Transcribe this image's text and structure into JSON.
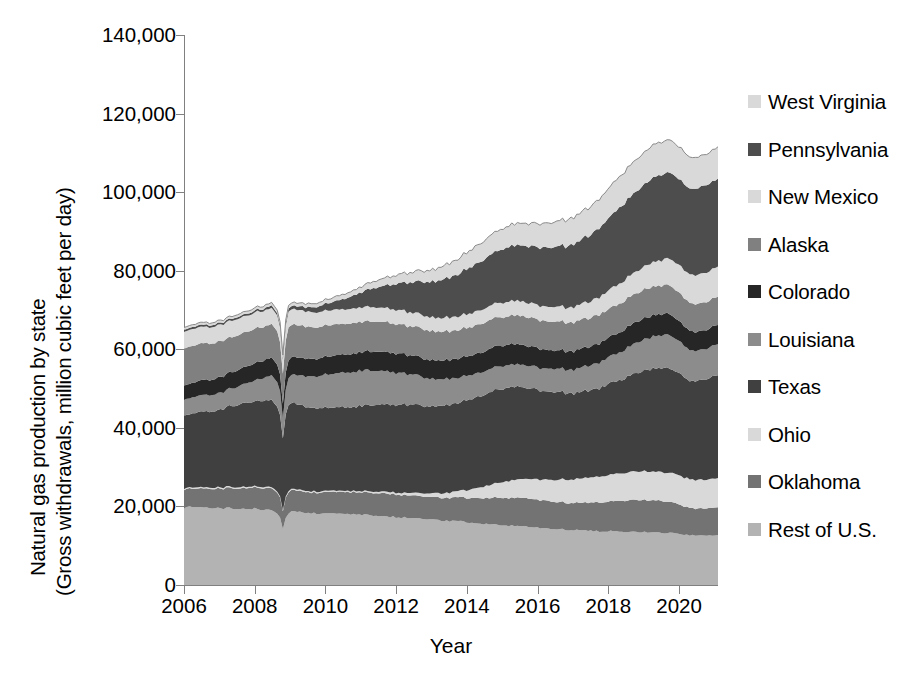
{
  "chart_data": {
    "type": "area",
    "stacked": true,
    "title": "",
    "xlabel": "Year",
    "ylabel": "Natural gas production by state (Gross withdrawals, million cubic feet per day)",
    "ylabel_line1": "Natural gas production by state",
    "ylabel_line2": "(Gross withdrawals, million cubic feet per day)",
    "xlim": [
      2006,
      2021.1
    ],
    "ylim": [
      0,
      140000
    ],
    "ytick_values": [
      0,
      20000,
      40000,
      60000,
      80000,
      100000,
      120000,
      140000
    ],
    "ytick_labels": [
      "0",
      "20,000",
      "40,000",
      "60,000",
      "80,000",
      "100,000",
      "120,000",
      "140,000"
    ],
    "xtick_values": [
      2006,
      2008,
      2010,
      2012,
      2014,
      2016,
      2018,
      2020
    ],
    "xtick_labels": [
      "2006",
      "2008",
      "2010",
      "2012",
      "2014",
      "2016",
      "2018",
      "2020"
    ],
    "grid": false,
    "legend_position": "right",
    "x": [
      2006.0,
      2006.25,
      2006.5,
      2006.75,
      2007.0,
      2007.25,
      2007.5,
      2007.75,
      2008.0,
      2008.25,
      2008.5,
      2008.7,
      2008.8,
      2008.9,
      2009.0,
      2009.25,
      2009.5,
      2009.75,
      2010.0,
      2010.25,
      2010.5,
      2010.75,
      2011.0,
      2011.25,
      2011.5,
      2011.75,
      2012.0,
      2012.25,
      2012.5,
      2012.75,
      2013.0,
      2013.25,
      2013.5,
      2013.75,
      2014.0,
      2014.25,
      2014.5,
      2014.75,
      2015.0,
      2015.25,
      2015.5,
      2015.75,
      2016.0,
      2016.25,
      2016.5,
      2016.75,
      2017.0,
      2017.25,
      2017.5,
      2017.75,
      2018.0,
      2018.25,
      2018.5,
      2018.75,
      2019.0,
      2019.25,
      2019.5,
      2019.75,
      2020.0,
      2020.25,
      2020.5,
      2020.75,
      2021.0
    ],
    "series": [
      {
        "name": "Rest of U.S.",
        "color": "#b3b3b3",
        "values": [
          19800,
          19900,
          19700,
          19600,
          19500,
          19600,
          19400,
          19500,
          19400,
          19200,
          19000,
          17600,
          14200,
          17800,
          18800,
          18500,
          18400,
          18200,
          18300,
          18200,
          18000,
          17900,
          17900,
          17700,
          17600,
          17500,
          17300,
          17200,
          17000,
          16800,
          16600,
          16400,
          16300,
          16200,
          16000,
          15800,
          15600,
          15500,
          15300,
          15100,
          15000,
          14800,
          14600,
          14400,
          14300,
          14100,
          14000,
          13900,
          13800,
          13700,
          13700,
          13600,
          13600,
          13500,
          13500,
          13400,
          13300,
          13200,
          13000,
          12700,
          12600,
          12600,
          12700
        ]
      },
      {
        "name": "Oklahoma",
        "color": "#737373",
        "values": [
          4600,
          4700,
          4800,
          4900,
          5000,
          5100,
          5200,
          5300,
          5400,
          5500,
          5500,
          5300,
          4600,
          5400,
          5400,
          5300,
          5300,
          5300,
          5400,
          5500,
          5600,
          5600,
          5700,
          5700,
          5800,
          5800,
          5800,
          5700,
          5700,
          5700,
          5700,
          5800,
          5900,
          6000,
          6200,
          6400,
          6600,
          6800,
          7000,
          7100,
          7200,
          7200,
          7100,
          7000,
          6900,
          6900,
          6900,
          7000,
          7200,
          7400,
          7600,
          7800,
          8000,
          8100,
          8200,
          8200,
          8100,
          7900,
          7500,
          7000,
          6800,
          6900,
          7100
        ]
      },
      {
        "name": "Ohio",
        "color": "#d9d9d9",
        "values": [
          300,
          300,
          300,
          300,
          300,
          300,
          300,
          300,
          300,
          300,
          300,
          300,
          250,
          300,
          300,
          300,
          300,
          300,
          300,
          300,
          300,
          300,
          300,
          350,
          400,
          450,
          500,
          600,
          700,
          800,
          950,
          1100,
          1300,
          1600,
          2000,
          2500,
          3000,
          3500,
          4000,
          4400,
          4700,
          5000,
          5200,
          5400,
          5600,
          5800,
          6000,
          6200,
          6400,
          6600,
          6800,
          7000,
          7100,
          7200,
          7300,
          7300,
          7400,
          7400,
          7400,
          7300,
          7300,
          7300,
          7400
        ]
      },
      {
        "name": "Texas",
        "color": "#404040",
        "values": [
          18500,
          18800,
          19100,
          19500,
          19900,
          20300,
          20800,
          21200,
          21600,
          22000,
          22200,
          21400,
          18000,
          21800,
          21900,
          21600,
          21400,
          21200,
          21100,
          21200,
          21300,
          21500,
          21700,
          21900,
          22100,
          22300,
          22400,
          22400,
          22300,
          22200,
          22100,
          22200,
          22300,
          22500,
          22800,
          23100,
          23400,
          23600,
          23700,
          23600,
          23400,
          23200,
          22900,
          22500,
          22200,
          22000,
          21900,
          22000,
          22200,
          22500,
          23000,
          23600,
          24300,
          25000,
          25600,
          26100,
          26500,
          26700,
          26000,
          25200,
          25000,
          25400,
          26000
        ]
      },
      {
        "name": "Louisiana",
        "color": "#8c8c8c",
        "values": [
          4100,
          4100,
          4200,
          4200,
          4300,
          4400,
          4600,
          4900,
          5300,
          5800,
          6300,
          6200,
          5000,
          6600,
          7000,
          7400,
          7800,
          8100,
          8400,
          8600,
          8800,
          8900,
          9000,
          8900,
          8700,
          8500,
          8200,
          7900,
          7600,
          7300,
          7000,
          6800,
          6600,
          6400,
          6200,
          6100,
          6000,
          5900,
          5800,
          5700,
          5700,
          5700,
          5700,
          5800,
          5900,
          6000,
          6100,
          6200,
          6300,
          6500,
          6700,
          7000,
          7300,
          7600,
          7900,
          8100,
          8300,
          8400,
          8200,
          7900,
          7700,
          7700,
          7800
        ]
      },
      {
        "name": "Colorado",
        "color": "#262626",
        "values": [
          3600,
          3700,
          3800,
          3900,
          4000,
          4100,
          4200,
          4300,
          4400,
          4500,
          4500,
          4400,
          3800,
          4500,
          4500,
          4500,
          4500,
          4500,
          4500,
          4600,
          4600,
          4700,
          4700,
          4800,
          4800,
          4900,
          4900,
          4900,
          4800,
          4800,
          4800,
          4800,
          4800,
          4900,
          4900,
          5000,
          5100,
          5200,
          5200,
          5200,
          5100,
          5000,
          4900,
          4800,
          4700,
          4700,
          4700,
          4800,
          4800,
          4900,
          5000,
          5100,
          5200,
          5300,
          5400,
          5400,
          5400,
          5300,
          5100,
          4900,
          4800,
          4800,
          4900
        ]
      },
      {
        "name": "Alaska",
        "color": "#808080",
        "values": [
          9500,
          9400,
          9300,
          9200,
          9100,
          9000,
          8900,
          8800,
          8700,
          8600,
          8500,
          8400,
          7600,
          8400,
          8300,
          8200,
          8100,
          8000,
          8000,
          7900,
          7800,
          7800,
          7700,
          7700,
          7600,
          7600,
          7500,
          7500,
          7400,
          7400,
          7400,
          7300,
          7300,
          7300,
          7300,
          7300,
          7300,
          7300,
          7300,
          7300,
          7300,
          7300,
          7300,
          7300,
          7300,
          7300,
          7300,
          7300,
          7300,
          7300,
          7300,
          7300,
          7300,
          7300,
          7300,
          7300,
          7300,
          7300,
          7200,
          7100,
          7100,
          7100,
          7100
        ]
      },
      {
        "name": "New Mexico",
        "color": "#d9d9d9",
        "values": [
          4300,
          4300,
          4200,
          4200,
          4200,
          4200,
          4200,
          4100,
          4100,
          4100,
          4100,
          4000,
          3500,
          4000,
          4000,
          3900,
          3900,
          3800,
          3800,
          3800,
          3700,
          3700,
          3700,
          3700,
          3600,
          3600,
          3600,
          3600,
          3500,
          3500,
          3500,
          3500,
          3500,
          3500,
          3500,
          3500,
          3600,
          3600,
          3700,
          3700,
          3700,
          3700,
          3700,
          3700,
          3800,
          3800,
          3900,
          4000,
          4200,
          4400,
          4700,
          5000,
          5300,
          5600,
          5900,
          6200,
          6500,
          6800,
          7000,
          7200,
          7400,
          7500,
          7600
        ]
      },
      {
        "name": "Pennsylvania",
        "color": "#4d4d4d",
        "values": [
          500,
          500,
          500,
          500,
          500,
          500,
          500,
          500,
          500,
          550,
          600,
          600,
          550,
          700,
          800,
          900,
          1100,
          1400,
          1700,
          2100,
          2600,
          3200,
          3800,
          4500,
          5200,
          5900,
          6600,
          7200,
          7800,
          8400,
          9000,
          9600,
          10200,
          10800,
          11400,
          12000,
          12600,
          13100,
          13500,
          13900,
          14200,
          14500,
          14800,
          15000,
          15200,
          15500,
          15900,
          16400,
          17000,
          17700,
          18400,
          19100,
          19800,
          20400,
          20900,
          21300,
          21600,
          21800,
          21900,
          21800,
          21900,
          22100,
          22400
        ]
      },
      {
        "name": "West Virginia",
        "color": "#d9d9d9",
        "values": [
          600,
          600,
          600,
          600,
          600,
          600,
          650,
          650,
          700,
          700,
          750,
          750,
          650,
          800,
          800,
          850,
          900,
          950,
          1000,
          1100,
          1200,
          1300,
          1400,
          1600,
          1800,
          2000,
          2200,
          2400,
          2600,
          2800,
          3000,
          3300,
          3600,
          3900,
          4200,
          4500,
          4800,
          5000,
          5200,
          5400,
          5600,
          5800,
          6000,
          6200,
          6400,
          6600,
          6800,
          7000,
          7200,
          7400,
          7600,
          7800,
          8000,
          8100,
          8200,
          8300,
          8300,
          8300,
          8200,
          8000,
          7900,
          7900,
          8000
        ]
      }
    ],
    "legend_order": [
      "West Virginia",
      "Pennsylvania",
      "New Mexico",
      "Alaska",
      "Colorado",
      "Louisiana",
      "Texas",
      "Ohio",
      "Oklahoma",
      "Rest of U.S."
    ]
  },
  "axes": {
    "x_title": "Year",
    "y_title_line1": "Natural gas production by state",
    "y_title_line2": "(Gross withdrawals, million cubic feet per day)"
  },
  "legend": {
    "items": [
      {
        "label": "West Virginia",
        "color": "#d9d9d9"
      },
      {
        "label": "Pennsylvania",
        "color": "#4d4d4d"
      },
      {
        "label": "New Mexico",
        "color": "#d9d9d9"
      },
      {
        "label": "Alaska",
        "color": "#808080"
      },
      {
        "label": "Colorado",
        "color": "#262626"
      },
      {
        "label": "Louisiana",
        "color": "#8c8c8c"
      },
      {
        "label": "Texas",
        "color": "#404040"
      },
      {
        "label": "Ohio",
        "color": "#d9d9d9"
      },
      {
        "label": "Oklahoma",
        "color": "#737373"
      },
      {
        "label": "Rest of U.S.",
        "color": "#b3b3b3"
      }
    ]
  }
}
